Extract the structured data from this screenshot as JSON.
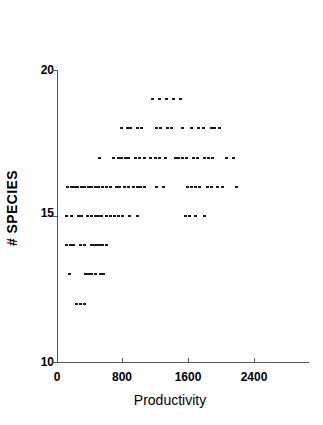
{
  "chart_data": {
    "type": "scatter",
    "title": "",
    "xlabel": "Productivity",
    "ylabel": "# SPECIES",
    "xlim": [
      0,
      2900
    ],
    "ylim": [
      10,
      20
    ],
    "xticks": [
      0,
      800,
      1600,
      2400
    ],
    "xtick_labels": [
      "0",
      "800",
      "1600",
      "2400"
    ],
    "yticks": [
      10,
      15,
      20
    ],
    "ytick_labels": [
      "10",
      "15",
      "20"
    ],
    "grid": false,
    "legend": null,
    "marker_color": "#1a1a1a",
    "axis_color": "#555555",
    "series": [
      {
        "name": "observations",
        "points": [
          [
            1160,
            19
          ],
          [
            1245,
            19
          ],
          [
            1330,
            19
          ],
          [
            1420,
            19
          ],
          [
            1510,
            19
          ],
          [
            790,
            18
          ],
          [
            860,
            18
          ],
          [
            900,
            18
          ],
          [
            985,
            18
          ],
          [
            1030,
            18
          ],
          [
            1215,
            18
          ],
          [
            1260,
            18
          ],
          [
            1350,
            18
          ],
          [
            1395,
            18
          ],
          [
            1530,
            18
          ],
          [
            1640,
            18
          ],
          [
            1720,
            18
          ],
          [
            1790,
            18
          ],
          [
            1880,
            18
          ],
          [
            1920,
            18
          ],
          [
            1985,
            18
          ],
          [
            515,
            17
          ],
          [
            690,
            17
          ],
          [
            745,
            17
          ],
          [
            790,
            17
          ],
          [
            830,
            17
          ],
          [
            875,
            17
          ],
          [
            960,
            17
          ],
          [
            1010,
            17
          ],
          [
            1060,
            17
          ],
          [
            1140,
            17
          ],
          [
            1195,
            17
          ],
          [
            1250,
            17
          ],
          [
            1320,
            17
          ],
          [
            1440,
            17
          ],
          [
            1485,
            17
          ],
          [
            1530,
            17
          ],
          [
            1575,
            17
          ],
          [
            1660,
            17
          ],
          [
            1715,
            17
          ],
          [
            1800,
            17
          ],
          [
            1845,
            17
          ],
          [
            1890,
            17
          ],
          [
            2060,
            17
          ],
          [
            2150,
            17
          ],
          [
            125,
            16
          ],
          [
            175,
            16
          ],
          [
            215,
            16
          ],
          [
            255,
            16
          ],
          [
            295,
            16
          ],
          [
            340,
            16
          ],
          [
            385,
            16
          ],
          [
            420,
            16
          ],
          [
            465,
            16
          ],
          [
            505,
            16
          ],
          [
            555,
            16
          ],
          [
            600,
            16
          ],
          [
            650,
            16
          ],
          [
            720,
            16
          ],
          [
            760,
            16
          ],
          [
            820,
            16
          ],
          [
            870,
            16
          ],
          [
            930,
            16
          ],
          [
            975,
            16
          ],
          [
            1015,
            16
          ],
          [
            1060,
            16
          ],
          [
            1215,
            16
          ],
          [
            1300,
            16
          ],
          [
            1590,
            16
          ],
          [
            1640,
            16
          ],
          [
            1690,
            16
          ],
          [
            1740,
            16
          ],
          [
            1830,
            16
          ],
          [
            1880,
            16
          ],
          [
            1950,
            16
          ],
          [
            2015,
            16
          ],
          [
            2185,
            16
          ],
          [
            110,
            15
          ],
          [
            180,
            15
          ],
          [
            260,
            15
          ],
          [
            300,
            15
          ],
          [
            375,
            15
          ],
          [
            420,
            15
          ],
          [
            465,
            15
          ],
          [
            505,
            15
          ],
          [
            545,
            15
          ],
          [
            605,
            15
          ],
          [
            650,
            15
          ],
          [
            700,
            15
          ],
          [
            750,
            15
          ],
          [
            800,
            15
          ],
          [
            880,
            15
          ],
          [
            985,
            15
          ],
          [
            1570,
            15
          ],
          [
            1620,
            15
          ],
          [
            1690,
            15
          ],
          [
            1800,
            15
          ],
          [
            110,
            14
          ],
          [
            160,
            14
          ],
          [
            205,
            14
          ],
          [
            290,
            14
          ],
          [
            330,
            14
          ],
          [
            420,
            14
          ],
          [
            455,
            14
          ],
          [
            490,
            14
          ],
          [
            525,
            14
          ],
          [
            560,
            14
          ],
          [
            600,
            14
          ],
          [
            155,
            13
          ],
          [
            345,
            13
          ],
          [
            385,
            13
          ],
          [
            425,
            13
          ],
          [
            465,
            13
          ],
          [
            530,
            13
          ],
          [
            570,
            13
          ],
          [
            240,
            12
          ],
          [
            290,
            12
          ],
          [
            330,
            12
          ]
        ]
      }
    ]
  },
  "axis": {
    "x_tick_labels": [
      "0",
      "800",
      "1600",
      "2400"
    ],
    "y_tick_labels": [
      "20",
      "15",
      "10"
    ],
    "x_title": "Productivity",
    "y_title": "# SPECIES"
  }
}
